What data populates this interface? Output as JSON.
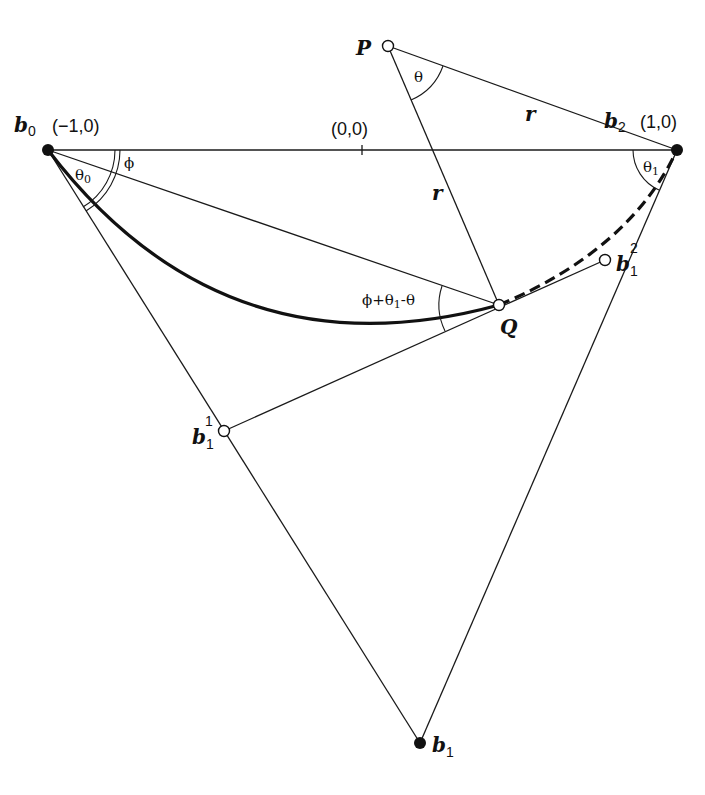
{
  "diagram": {
    "points": {
      "b0": {
        "label": "b",
        "sub": "0",
        "coord": "(−1,0)",
        "x": 48,
        "y": 150,
        "style": "solid"
      },
      "b2": {
        "label": "b",
        "sub": "2",
        "coord": "(1,0)",
        "x": 677,
        "y": 150,
        "style": "solid"
      },
      "origin": {
        "coord": "(0,0)",
        "x": 362,
        "y": 150
      },
      "P": {
        "label": "P",
        "x": 388,
        "y": 46,
        "style": "open"
      },
      "Q": {
        "label": "Q",
        "x": 499,
        "y": 305,
        "style": "open"
      },
      "b1_1": {
        "label": "b",
        "sub": "1",
        "sup": "1",
        "x": 224,
        "y": 431,
        "style": "open"
      },
      "b1_2": {
        "label": "b",
        "sub": "1",
        "sup": "2",
        "x": 605,
        "y": 260,
        "style": "open"
      },
      "b1": {
        "label": "b",
        "sub": "1",
        "x": 420,
        "y": 743,
        "style": "solid"
      }
    },
    "segment_labels": {
      "r_upper": "r",
      "r_lower": "r"
    },
    "angles": {
      "theta": {
        "label": "θ"
      },
      "theta0": {
        "label": "θ",
        "sub": "0"
      },
      "theta1": {
        "label": "θ",
        "sub": "1"
      },
      "phi": {
        "label": "ϕ"
      },
      "combo": {
        "label_pre": "ϕ+θ",
        "sub": "1",
        "label_post": "-θ"
      }
    },
    "curves": {
      "solid_segment": "b0 to Q (solid, thick)",
      "dashed_segment": "Q to b2 (dashed, thick)"
    },
    "colors": {
      "ink": "#111111",
      "background": "#ffffff"
    }
  }
}
